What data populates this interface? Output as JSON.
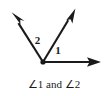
{
  "figure": {
    "background_color": "#ffffff",
    "stroke_color": "#1a1a1a",
    "caption": "∠1 and ∠2",
    "labels": {
      "angle_one": "1",
      "angle_two": "2"
    },
    "geometry": {
      "vertex": {
        "x": 43,
        "y": 62
      },
      "rays": [
        {
          "name": "horizontal-right-ray",
          "from": {
            "x": 43,
            "y": 62
          },
          "to": {
            "x": 100,
            "y": 62
          },
          "arrowhead": "end"
        },
        {
          "name": "middle-upper-right-ray",
          "from": {
            "x": 43,
            "y": 62
          },
          "to": {
            "x": 75,
            "y": 9
          },
          "arrowhead": "end"
        },
        {
          "name": "upper-left-ray",
          "from": {
            "x": 43,
            "y": 62
          },
          "to": {
            "x": 12,
            "y": 13
          },
          "arrowhead": "end"
        }
      ],
      "label_positions": {
        "angle_one": {
          "x": 58,
          "y": 54
        },
        "angle_two": {
          "x": 37,
          "y": 44
        }
      },
      "caption_position": {
        "x": 54,
        "y": 87
      }
    }
  }
}
